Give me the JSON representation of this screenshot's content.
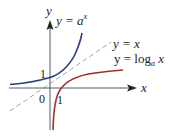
{
  "diagram": {
    "axes": {
      "x_label": "x",
      "y_label": "y",
      "origin_label": "0"
    },
    "tick_labels": {
      "y_one": "1",
      "x_one": "1"
    },
    "curves": [
      {
        "name": "exponential",
        "label_prefix": "y = ",
        "label_base": "a",
        "label_exp": "x",
        "color": "#2b3f7a"
      },
      {
        "name": "identity",
        "label": "y = x",
        "color": "#9aa6b8",
        "style": "dashed"
      },
      {
        "name": "logarithm",
        "label_prefix": "y = log",
        "label_sub": "a",
        "label_suffix": " x",
        "color": "#a0302a"
      }
    ]
  }
}
